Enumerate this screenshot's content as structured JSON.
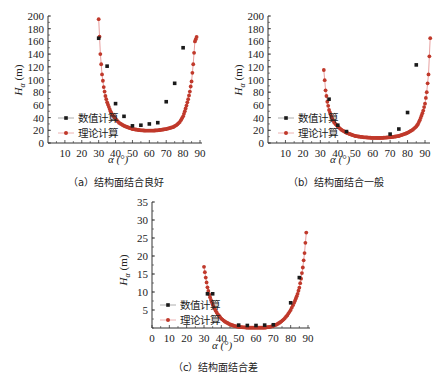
{
  "chart_data": [
    {
      "id": "a",
      "type": "scatter",
      "title": "(a) 结构面结合良好",
      "xlabel": "α (°)",
      "ylabel": "Hα (m)",
      "xlim": [
        0,
        90
      ],
      "ylim": [
        0,
        200
      ],
      "xticks": [
        10,
        20,
        30,
        40,
        50,
        60,
        70,
        80,
        90
      ],
      "yticks": [
        0,
        20,
        40,
        60,
        80,
        100,
        120,
        140,
        160,
        180,
        200
      ],
      "legend": [
        "数值计算",
        "理论计算"
      ],
      "legend_position": "lower-left",
      "grid": false,
      "series": [
        {
          "name": "数值计算",
          "style": "black-square-markers",
          "x": [
            30,
            35,
            40,
            45,
            50,
            55,
            60,
            65,
            70,
            75,
            80
          ],
          "y": [
            165,
            121,
            62,
            42,
            27,
            28,
            30,
            32,
            65,
            94,
            150
          ]
        },
        {
          "name": "理论计算",
          "style": "red-line-with-dots",
          "x": [
            30,
            31,
            32,
            33,
            34,
            35,
            36,
            37,
            38,
            40,
            42,
            45,
            48,
            50,
            55,
            58,
            60,
            62,
            65,
            70,
            74,
            76,
            78,
            80,
            81,
            82,
            83,
            84,
            85,
            86,
            87,
            88
          ],
          "y": [
            195,
            140,
            108,
            88,
            74,
            64,
            57,
            50,
            45,
            38,
            32,
            27,
            24,
            22,
            20,
            19.5,
            19.5,
            19.5,
            20,
            22,
            25,
            28,
            33,
            42,
            50,
            59,
            69,
            81,
            97,
            124,
            160,
            167
          ]
        }
      ]
    },
    {
      "id": "b",
      "type": "scatter",
      "title": "(b) 结构面结合一般",
      "xlabel": "α (°)",
      "ylabel": "Hα (m)",
      "xlim": [
        0,
        95
      ],
      "ylim": [
        0,
        200
      ],
      "xticks": [
        10,
        20,
        30,
        40,
        50,
        60,
        70,
        80,
        90
      ],
      "yticks": [
        0,
        20,
        40,
        60,
        80,
        100,
        120,
        140,
        160,
        180,
        200
      ],
      "legend": [
        "数值计算",
        "理论计算"
      ],
      "legend_position": "lower-left",
      "grid": false,
      "series": [
        {
          "name": "数值计算",
          "style": "black-square-markers",
          "x": [
            35,
            40,
            45,
            70,
            75,
            80,
            85
          ],
          "y": [
            69,
            28,
            18,
            14,
            22,
            48,
            123
          ]
        },
        {
          "name": "理论计算",
          "style": "red-line-with-dots",
          "x": [
            32,
            33,
            34,
            35,
            36,
            37,
            38,
            40,
            42,
            45,
            48,
            50,
            55,
            60,
            62,
            65,
            70,
            75,
            80,
            83,
            85,
            86,
            87,
            88,
            89,
            90,
            91,
            92,
            93
          ],
          "y": [
            115,
            83,
            65,
            52,
            44,
            37,
            32,
            26,
            21,
            16,
            13,
            11,
            9,
            8,
            8,
            8,
            9,
            11,
            16,
            21,
            26,
            30,
            36,
            43,
            51,
            62,
            80,
            108,
            165
          ]
        }
      ]
    },
    {
      "id": "c",
      "type": "scatter",
      "title": "(c) 结构面结合差",
      "xlabel": "α (°)",
      "ylabel": "Hα (m)",
      "xlim": [
        0,
        90
      ],
      "ylim": [
        0,
        35
      ],
      "xticks": [
        0,
        10,
        20,
        30,
        40,
        50,
        60,
        70,
        80,
        90
      ],
      "yticks": [
        5,
        10,
        15,
        20,
        25,
        30,
        35
      ],
      "legend": [
        "数值计算",
        "理论计算"
      ],
      "legend_position": "lower-left",
      "grid": false,
      "series": [
        {
          "name": "数值计算",
          "style": "black-square-markers",
          "x": [
            32,
            35,
            50,
            55,
            60,
            65,
            70,
            80,
            85
          ],
          "y": [
            9.5,
            9.5,
            0.8,
            0.7,
            0.7,
            0.8,
            0.9,
            7,
            14
          ]
        },
        {
          "name": "理论计算",
          "style": "red-line-with-dots",
          "x": [
            30,
            31,
            32,
            33,
            34,
            35,
            36,
            38,
            40,
            42,
            45,
            48,
            50,
            55,
            60,
            65,
            68,
            70,
            72,
            74,
            76,
            78,
            80,
            82,
            83,
            84,
            85,
            86,
            87,
            88,
            89
          ],
          "y": [
            17,
            14,
            11.3,
            9.3,
            7.8,
            6.5,
            5.4,
            3.8,
            2.6,
            1.8,
            1.0,
            0.5,
            0.3,
            0.1,
            0.1,
            0.1,
            0.3,
            0.6,
            1.0,
            1.6,
            2.4,
            3.5,
            5.0,
            7.0,
            8.2,
            9.5,
            11.2,
            13.7,
            16.8,
            20.8,
            26.5
          ]
        }
      ]
    }
  ],
  "captions": {
    "a": "（a）结构面结合良好",
    "b": "（b）结构面结合一般",
    "c": "（c）结构面结合差"
  },
  "legend": {
    "numeric": "数值计算",
    "theory": "理论计算"
  },
  "axes": {
    "xlabel": "α (°)",
    "ylabel_main": "H",
    "ylabel_sub": "α",
    "ylabel_unit": " (m)"
  },
  "colors": {
    "numeric": "#1a1a1a",
    "theory": "#c0392b",
    "theory_line": "#e8a0a0",
    "axis": "#333333"
  }
}
